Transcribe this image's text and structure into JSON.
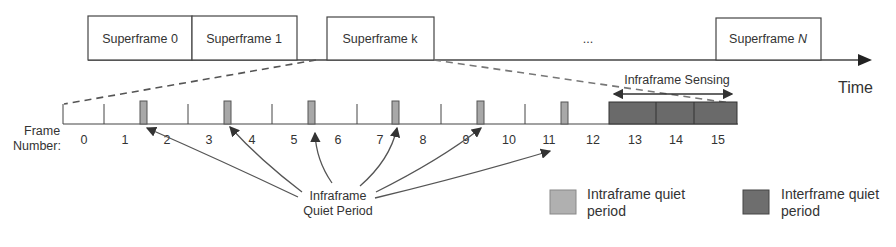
{
  "superframes": [
    {
      "label": "Superframe 0"
    },
    {
      "label": "Superframe 1"
    },
    {
      "label": "Superframe k"
    },
    {
      "label": "..."
    },
    {
      "label": "Superframe ",
      "italic_suffix": "N"
    }
  ],
  "time_axis": {
    "label": "Time"
  },
  "frame_axis": {
    "label_line1": "Frame",
    "label_line2": "Number:",
    "frame_numbers": [
      "0",
      "1",
      "2",
      "3",
      "4",
      "5",
      "6",
      "7",
      "8",
      "9",
      "10",
      "11",
      "12",
      "13",
      "14",
      "15"
    ]
  },
  "sensing": {
    "label": "Infraframe Sensing"
  },
  "annotation": {
    "line1": "Infraframe",
    "line2": "Quiet Period"
  },
  "legend": [
    {
      "line1": "Intraframe quiet",
      "line2": "period",
      "color": "#b0b0b0"
    },
    {
      "line1": "Interframe quiet",
      "line2": "period",
      "color": "#6e6e6e"
    }
  ],
  "colors": {
    "line": "#444444",
    "intraframe": "#a8a8a8",
    "interframe": "#6a6a6a"
  }
}
